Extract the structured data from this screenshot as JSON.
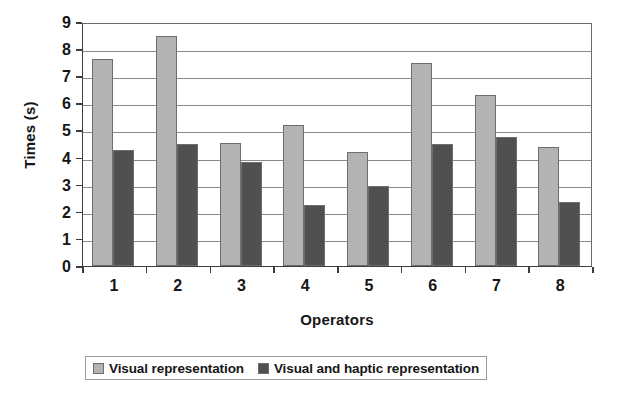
{
  "chart_data": {
    "type": "bar",
    "title": "",
    "xlabel": "Operators",
    "ylabel": "Times (s)",
    "categories": [
      "1",
      "2",
      "3",
      "4",
      "5",
      "6",
      "7",
      "8"
    ],
    "series": [
      {
        "name": "Visual representation",
        "color": "#b3b3b3",
        "values": [
          7.65,
          8.5,
          4.55,
          5.2,
          4.2,
          7.5,
          6.3,
          4.4
        ]
      },
      {
        "name": "Visual and haptic representation",
        "color": "#505050",
        "values": [
          4.28,
          4.5,
          3.85,
          2.25,
          2.95,
          4.5,
          4.75,
          2.35
        ]
      }
    ],
    "ylim": [
      0,
      9
    ],
    "ytick_labels": [
      "0",
      "1",
      "2",
      "3",
      "4",
      "5",
      "6",
      "7",
      "8",
      "9"
    ],
    "ytick_values": [
      0,
      1,
      2,
      3,
      4,
      5,
      6,
      7,
      8,
      9
    ],
    "grid": true,
    "grid_axis": "y",
    "legend_position": "bottom",
    "bar_border_color": "#6e6e6e",
    "axis_color": "#3d3d3d",
    "gridline_color": "#8a8a8a",
    "plot_background": "#ffffff"
  },
  "legend": {
    "items": [
      {
        "label": "Visual representation",
        "color": "#b3b3b3"
      },
      {
        "label": "Visual and haptic representation",
        "color": "#505050"
      }
    ]
  }
}
